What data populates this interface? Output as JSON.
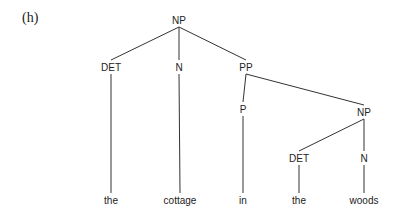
{
  "figure_label": "(h)",
  "tree": {
    "nodes": [
      {
        "id": "np1",
        "label": "NP",
        "x": 179,
        "y": 20
      },
      {
        "id": "det1",
        "label": "DET",
        "x": 111,
        "y": 67
      },
      {
        "id": "n1",
        "label": "N",
        "x": 179,
        "y": 67
      },
      {
        "id": "pp",
        "label": "PP",
        "x": 246,
        "y": 67
      },
      {
        "id": "p",
        "label": "P",
        "x": 243,
        "y": 109
      },
      {
        "id": "np2",
        "label": "NP",
        "x": 364,
        "y": 112
      },
      {
        "id": "det2",
        "label": "DET",
        "x": 299,
        "y": 158
      },
      {
        "id": "n2",
        "label": "N",
        "x": 364,
        "y": 158
      },
      {
        "id": "w1",
        "label": "the",
        "x": 111,
        "y": 200
      },
      {
        "id": "w2",
        "label": "cottage",
        "x": 180,
        "y": 200
      },
      {
        "id": "w3",
        "label": "in",
        "x": 243,
        "y": 200
      },
      {
        "id": "w4",
        "label": "the",
        "x": 299,
        "y": 200
      },
      {
        "id": "w5",
        "label": "woods",
        "x": 364,
        "y": 200
      }
    ],
    "edges": [
      [
        "np1",
        "det1"
      ],
      [
        "np1",
        "n1"
      ],
      [
        "np1",
        "pp"
      ],
      [
        "det1",
        "w1"
      ],
      [
        "n1",
        "w2"
      ],
      [
        "pp",
        "p"
      ],
      [
        "pp",
        "np2"
      ],
      [
        "p",
        "w3"
      ],
      [
        "np2",
        "det2"
      ],
      [
        "np2",
        "n2"
      ],
      [
        "det2",
        "w4"
      ],
      [
        "n2",
        "w5"
      ]
    ]
  }
}
